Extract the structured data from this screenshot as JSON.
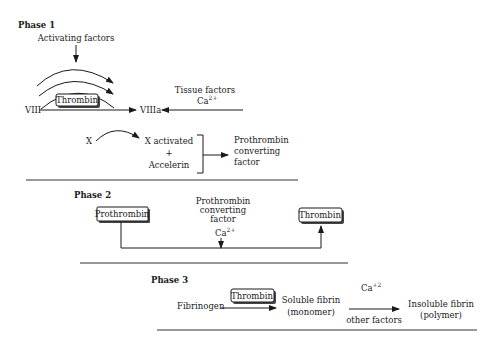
{
  "figure": {
    "phases": [
      {
        "label": "Phase 1",
        "activating_factors": "Activating factors",
        "viii": "VIII",
        "thrombin_box": "Thrombin",
        "viiia": "VIIIa",
        "tissue_factors": "Tissue factors",
        "ca": "Ca",
        "ca_sup": "2+",
        "x": "X",
        "x_activated": "X activated",
        "plus": "+",
        "accelerin": "Accelerin",
        "product_line1": "Prothrombin",
        "product_line2": "converting",
        "product_line3": "factor"
      },
      {
        "label": "Phase 2",
        "prothrombin_box": "Prothrombin",
        "converter_line1": "Prothrombin",
        "converter_line2": "converting",
        "converter_line3": "factor",
        "ca": "Ca",
        "ca_sup": "2+",
        "thrombin_box": "Thrombin"
      },
      {
        "label": "Phase 3",
        "fibrinogen": "Fibrinogen",
        "thrombin_box": "Thrombin",
        "soluble_line1": "Soluble fibrin",
        "soluble_line2": "(monomer)",
        "ca": "Ca",
        "ca_sup": "+2",
        "other_factors": "other factors",
        "insoluble_line1": "Insoluble fibrin",
        "insoluble_line2": "(polymer)"
      }
    ]
  }
}
